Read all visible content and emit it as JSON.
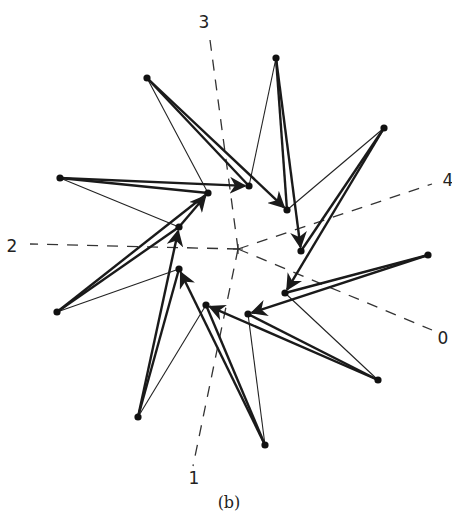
{
  "figure": {
    "caption": "(b)",
    "axis_labels": [
      {
        "id": "0",
        "text": "0",
        "x": 443,
        "y": 344
      },
      {
        "id": "1",
        "text": "1",
        "x": 194,
        "y": 484
      },
      {
        "id": "2",
        "text": "2",
        "x": 12,
        "y": 252
      },
      {
        "id": "3",
        "text": "3",
        "x": 204,
        "y": 28
      },
      {
        "id": "4",
        "text": "4",
        "x": 448,
        "y": 186
      }
    ],
    "center": {
      "x": 238,
      "y": 249
    },
    "axes": [
      {
        "label": "0",
        "x1": 238,
        "y1": 249,
        "x2": 432,
        "y2": 330
      },
      {
        "label": "1",
        "x1": 238,
        "y1": 249,
        "x2": 193,
        "y2": 466
      },
      {
        "label": "2",
        "x1": 238,
        "y1": 249,
        "x2": 30,
        "y2": 244
      },
      {
        "label": "3",
        "x1": 238,
        "y1": 249,
        "x2": 210,
        "y2": 40
      },
      {
        "label": "4",
        "x1": 238,
        "y1": 249,
        "x2": 432,
        "y2": 184
      }
    ],
    "inner_nodes": [
      {
        "id": "A",
        "x": 208,
        "y": 193
      },
      {
        "id": "B",
        "x": 249,
        "y": 186
      },
      {
        "id": "C",
        "x": 287,
        "y": 210
      },
      {
        "id": "D",
        "x": 301,
        "y": 251
      },
      {
        "id": "E",
        "x": 285,
        "y": 293
      },
      {
        "id": "F",
        "x": 248,
        "y": 314
      },
      {
        "id": "G",
        "x": 206,
        "y": 305
      },
      {
        "id": "H",
        "x": 179,
        "y": 269
      },
      {
        "id": "J",
        "x": 179,
        "y": 227
      }
    ],
    "outer_nodes": [
      {
        "id": "O1",
        "x": 60,
        "y": 178
      },
      {
        "id": "O2",
        "x": 147,
        "y": 78
      },
      {
        "id": "O3",
        "x": 276,
        "y": 58
      },
      {
        "id": "O4",
        "x": 384,
        "y": 128
      },
      {
        "id": "O5",
        "x": 428,
        "y": 255
      },
      {
        "id": "O6",
        "x": 378,
        "y": 380
      },
      {
        "id": "O7",
        "x": 265,
        "y": 445
      },
      {
        "id": "O8",
        "x": 138,
        "y": 417
      },
      {
        "id": "O9",
        "x": 57,
        "y": 312
      }
    ],
    "heavy_edges": [
      {
        "from": "O1",
        "to": "B",
        "arrow": true
      },
      {
        "from": "J",
        "to": "A",
        "arrow": true
      },
      {
        "from": "O2",
        "to": "C",
        "arrow": true
      },
      {
        "from": "O3",
        "to": "D",
        "arrow": true
      },
      {
        "from": "O4",
        "to": "E",
        "arrow": true
      },
      {
        "from": "O5",
        "to": "F",
        "arrow": true
      },
      {
        "from": "O6",
        "to": "G",
        "arrow": true
      },
      {
        "from": "O7",
        "to": "H",
        "arrow": true
      },
      {
        "from": "O8",
        "to": "J",
        "arrow": true
      },
      {
        "from": "O9",
        "to": "A",
        "arrow": false
      },
      {
        "from": "A",
        "to": "O1",
        "arrow": false
      },
      {
        "from": "B",
        "to": "O2",
        "arrow": false
      },
      {
        "from": "C",
        "to": "O3",
        "arrow": false
      },
      {
        "from": "D",
        "to": "O4",
        "arrow": false
      },
      {
        "from": "E",
        "to": "O5",
        "arrow": false
      },
      {
        "from": "F",
        "to": "O6",
        "arrow": false
      },
      {
        "from": "G",
        "to": "O7",
        "arrow": false
      },
      {
        "from": "H",
        "to": "O8",
        "arrow": false
      },
      {
        "from": "J",
        "to": "O9",
        "arrow": false
      }
    ],
    "thin_edges": [
      {
        "from": "O1",
        "to": "J"
      },
      {
        "from": "O2",
        "to": "A"
      },
      {
        "from": "O3",
        "to": "B"
      },
      {
        "from": "O4",
        "to": "C"
      },
      {
        "from": "O5",
        "to": "E"
      },
      {
        "from": "O6",
        "to": "E"
      },
      {
        "from": "O7",
        "to": "F"
      },
      {
        "from": "O8",
        "to": "G"
      },
      {
        "from": "O9",
        "to": "H"
      }
    ],
    "colors": {
      "ink": "#1a1a1a",
      "background": "#ffffff"
    }
  }
}
